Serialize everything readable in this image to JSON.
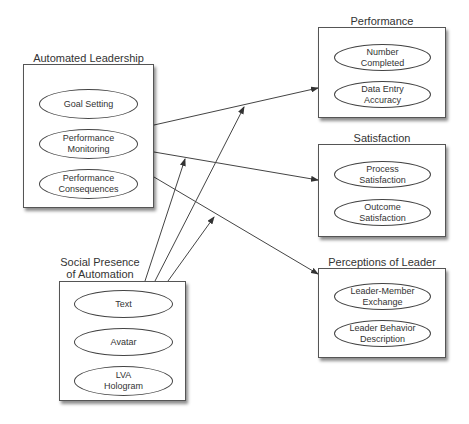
{
  "groups": {
    "automated_leadership": {
      "title": "Automated Leadership",
      "items": [
        "Goal Setting",
        "Performance Monitoring",
        "Performance Consequences"
      ]
    },
    "social_presence": {
      "title_line1": "Social Presence",
      "title_line2": "of Automation",
      "items": [
        "Text",
        "Avatar",
        "LVA Hologram"
      ]
    },
    "performance": {
      "title": "Performance",
      "items": [
        "Number Completed",
        "Data Entry Accuracy"
      ]
    },
    "satisfaction": {
      "title": "Satisfaction",
      "items": [
        "Process Satisfaction",
        "Outcome Satisfaction"
      ]
    },
    "perceptions_of_leader": {
      "title": "Perceptions of Leader",
      "items": [
        "Leader-Member Exchange",
        "Leader Behavior Description"
      ]
    }
  },
  "edges": [
    {
      "from": "Automated Leadership",
      "to": "Performance"
    },
    {
      "from": "Automated Leadership",
      "to": "Satisfaction"
    },
    {
      "from": "Automated Leadership",
      "to": "Perceptions of Leader"
    },
    {
      "from": "Social Presence of Automation",
      "to": "Automated Leadership → Performance (moderation)"
    },
    {
      "from": "Social Presence of Automation",
      "to": "Automated Leadership → Satisfaction (moderation)"
    },
    {
      "from": "Social Presence of Automation",
      "to": "Automated Leadership → Perceptions of Leader (moderation)"
    }
  ]
}
